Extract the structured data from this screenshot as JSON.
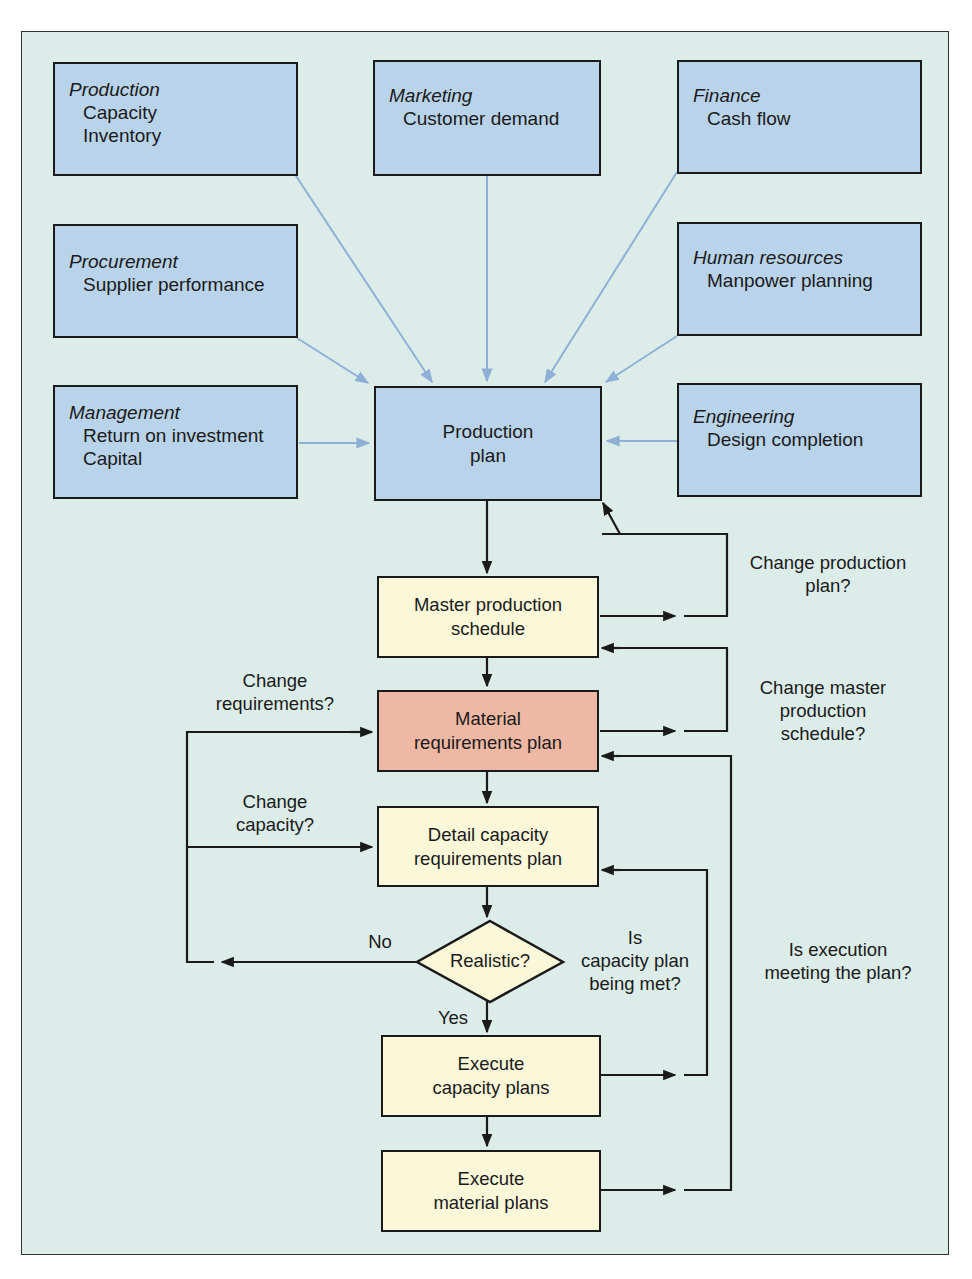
{
  "departments": [
    {
      "title": "Production",
      "items": [
        "Capacity",
        "Inventory"
      ]
    },
    {
      "title": "Marketing",
      "items": [
        "Customer demand"
      ]
    },
    {
      "title": "Finance",
      "items": [
        "Cash flow"
      ]
    },
    {
      "title": "Procurement",
      "items": [
        "Supplier performance"
      ]
    },
    {
      "title": "Human resources",
      "items": [
        "Manpower planning"
      ]
    },
    {
      "title": "Management",
      "items": [
        "Return on investment",
        "Capital"
      ]
    },
    {
      "title": "Engineering",
      "items": [
        "Design completion"
      ]
    }
  ],
  "production_plan": [
    "Production",
    "plan"
  ],
  "flow_steps": [
    [
      "Master production",
      "schedule"
    ],
    [
      "Material",
      "requirements plan"
    ],
    [
      "Detail capacity",
      "requirements plan"
    ],
    [
      "Execute",
      "capacity plans"
    ],
    [
      "Execute",
      "material plans"
    ]
  ],
  "decision": {
    "label": "Realistic?",
    "no": "No",
    "yes": "Yes"
  },
  "feedback_labels": {
    "change_production_plan": [
      "Change production",
      "plan?"
    ],
    "change_mps": [
      "Change master",
      "production",
      "schedule?"
    ],
    "change_requirements": [
      "Change",
      "requirements?"
    ],
    "change_capacity": [
      "Change",
      "capacity?"
    ],
    "capacity_plan_met": [
      "Is",
      "capacity plan",
      "being met?"
    ],
    "execution_meeting": [
      "Is execution",
      "meeting the plan?"
    ]
  },
  "colors": {
    "dept_fill": "#b9d3ea",
    "flow_fill": "#fbf8d9",
    "mrp_fill": "#eeb8a4",
    "background": "#dcece9",
    "input_arrow": "#8fb0d6"
  }
}
